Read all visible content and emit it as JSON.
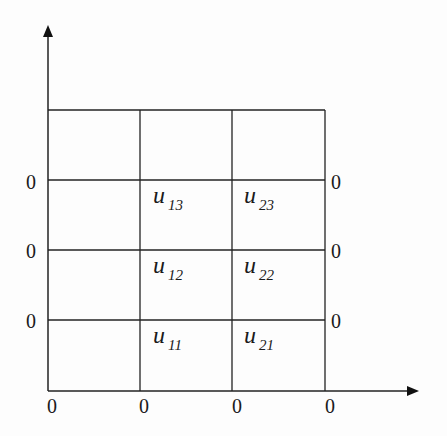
{
  "diagram": {
    "left_labels": [
      "0",
      "0",
      "0"
    ],
    "right_labels": [
      "0",
      "0",
      "0"
    ],
    "bottom_labels": [
      "0",
      "0",
      "0",
      "0"
    ],
    "cells": [
      {
        "base": "u",
        "sub": "13"
      },
      {
        "base": "u",
        "sub": "23"
      },
      {
        "base": "u",
        "sub": "12"
      },
      {
        "base": "u",
        "sub": "22"
      },
      {
        "base": "u",
        "sub": "11"
      },
      {
        "base": "u",
        "sub": "21"
      }
    ],
    "line_color": "#222222"
  }
}
